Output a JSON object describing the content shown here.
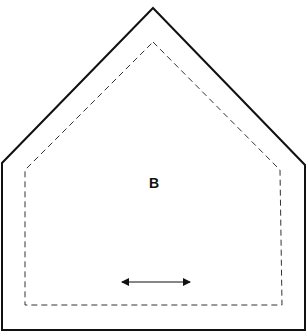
{
  "diagram": {
    "type": "pattern-piece",
    "shape": "pentagon (house shape)",
    "piece_label": "B",
    "outline": {
      "style": "solid",
      "color": "#111111",
      "points": "153,8 305,165 305,330 2,330 2,163"
    },
    "seam_line": {
      "style": "dashed",
      "color": "#333333",
      "points": "153,42 280,170 282,305 25,305 25,170"
    },
    "grainline": {
      "direction": "horizontal",
      "symbol": "double-headed-arrow",
      "x1": 122,
      "x2": 190,
      "y": 282
    }
  }
}
